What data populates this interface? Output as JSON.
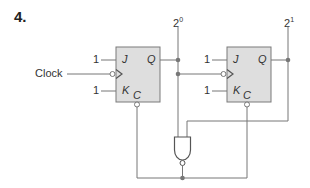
{
  "problem": {
    "number": "4."
  },
  "inputs": {
    "clock_label": "Clock",
    "j_value": "1",
    "k_value": "1"
  },
  "outputs": {
    "bit0": {
      "base": "2",
      "exp": "0"
    },
    "bit1": {
      "base": "2",
      "exp": "1"
    }
  },
  "flipflops": [
    {
      "j": "J",
      "k": "K",
      "q": "Q",
      "c": "C",
      "j_in": "1",
      "k_in": "1"
    },
    {
      "j": "J",
      "k": "K",
      "q": "Q",
      "c": "C",
      "j_in": "1",
      "k_in": "1"
    }
  ],
  "colors": {
    "ff_fill": "#dedede",
    "ff_border": "#7a7a7a",
    "wire": "#777777",
    "junction": "#777777"
  },
  "gate": {
    "type": "NAND"
  }
}
